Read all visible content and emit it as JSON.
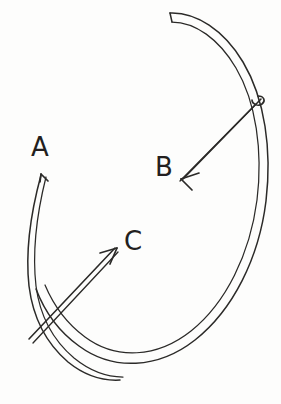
{
  "figure": {
    "background_color": "#fdfdfc",
    "ink_color": "#2b2a28",
    "width": 281,
    "height": 404,
    "labels": [
      {
        "id": "A",
        "text": "A",
        "x": 31,
        "y": 134,
        "describes": "vector-a"
      },
      {
        "id": "B",
        "text": "B",
        "x": 155,
        "y": 154,
        "describes": "vector-b"
      },
      {
        "id": "C",
        "text": "C",
        "x": 124,
        "y": 228,
        "describes": "vector-c"
      }
    ],
    "shapes": {
      "large_band": {
        "name": "large-curved-band",
        "description": "Long double-stroked ribbon sweeping from a blunt squared end at top-left, arcing right and down around to the bottom-left",
        "outer_path": "M 170 13 C 196 12 224 30 243 62 C 265 99 272 150 266 201 C 259 258 233 310 195 340 C 158 369 113 371 79 346 C 58 331 44 310 36 289",
        "inner_path": "M 172 22 C 195 22 219 39 236 68 C 256 102 263 151 257 200 C 250 254 226 303 191 331 C 157 358 116 360 85 337 C 66 323 53 304 45 285",
        "blunt_cap_path": "M 170 13 L 172 22"
      },
      "small_band": {
        "name": "small-curved-band",
        "description": "Shorter double-stroked ribbon on the left, running from the A arrow tip at the top, bowing left, and crossing down to the lower right",
        "outer_path": "M 41 175 C 31 212 25 250 29 286 C 33 318 47 344 68 362 C 84 375 103 381 120 380",
        "inner_path": "M 46 177 C 37 213 32 251 36 286 C 40 317 54 341 74 358 C 90 371 107 377 123 377"
      }
    },
    "vectors": [
      {
        "id": "vector-a",
        "name": "vector-a",
        "label": "A",
        "direction": "up",
        "shaft_path": "M 41 175 L 41 176",
        "head_paths": [
          "M 41 174 L 48 181",
          "M 41 174 L 40 182"
        ],
        "tip": {
          "x": 41,
          "y": 174
        },
        "note": "Arrowhead sits at the top end of the small curved band, pointing upward"
      },
      {
        "id": "vector-b",
        "name": "vector-b",
        "label": "B",
        "direction": "down-left",
        "shaft_path_outer": "M 261 99 L 183 179",
        "shaft_path_inner": "M 256 104 L 180 181",
        "tail_hook_path": "M 258 96 C 264 96 266 101 262 104 C 258 107 252 104 252 100",
        "head_paths": [
          "M 181 179 L 199 173",
          "M 181 179 L 192 190"
        ],
        "tip": {
          "x": 181,
          "y": 179
        },
        "tail": {
          "x": 260,
          "y": 100
        },
        "note": "Arrow runs from a hooked tail crossing the large band down-left to the B label"
      },
      {
        "id": "vector-c",
        "name": "vector-c",
        "label": "C",
        "direction": "up-right",
        "shaft_path_outer": "M 29 339 L 115 248",
        "shaft_path_inner": "M 33 343 L 118 252",
        "head_paths": [
          "M 117 248 L 100 253",
          "M 117 248 L 110 264"
        ],
        "tip": {
          "x": 117,
          "y": 248
        },
        "tail": {
          "x": 30,
          "y": 340
        },
        "note": "Arrow runs from lower-left, crossing the small band, up-right toward the C label"
      }
    ]
  }
}
